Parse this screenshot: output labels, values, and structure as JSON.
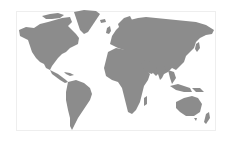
{
  "map": {
    "type": "world-map",
    "projection": "equirectangular-like",
    "land_color": "#8c8c8c",
    "ocean_color": "#ffffff",
    "border_color": "#eeeeee",
    "regions": [
      "North America",
      "Greenland",
      "South America",
      "Europe",
      "Africa",
      "Asia",
      "Australia",
      "New Zealand",
      "Antarctica-excluded"
    ]
  }
}
